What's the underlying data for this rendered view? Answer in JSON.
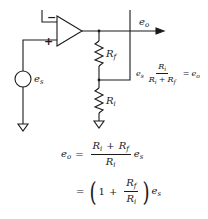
{
  "diagram": {
    "colors": {
      "line": "#1a1a1a",
      "background": "#ffffff"
    },
    "components": {
      "opamp": {
        "minus_label": "−",
        "plus_label": "+"
      },
      "source": {
        "label_base": "e",
        "label_sub": "s"
      },
      "feedback_resistor": {
        "label_base": "R",
        "label_sub": "f"
      },
      "input_resistor": {
        "label_base": "R",
        "label_sub": "i"
      },
      "output": {
        "label_base": "e",
        "label_sub": "o"
      }
    },
    "annotation": {
      "lhs_base": "e",
      "lhs_sub": "s",
      "num_base": "R",
      "num_sub": "i",
      "den_a_base": "R",
      "den_a_sub": "i",
      "den_plus": "+",
      "den_b_base": "R",
      "den_b_sub": "f",
      "equals": "=",
      "rhs_base": "e",
      "rhs_sub": "o"
    },
    "equations": [
      {
        "lhs_base": "e",
        "lhs_sub": "o",
        "equals": "=",
        "num_a_base": "R",
        "num_a_sub": "i",
        "num_plus": "+",
        "num_b_base": "R",
        "num_b_sub": "f",
        "den_base": "R",
        "den_sub": "i",
        "factor_base": "e",
        "factor_sub": "s"
      },
      {
        "equals": "=",
        "open_paren": "(",
        "one": "1",
        "plus": "+",
        "num_base": "R",
        "num_sub": "f",
        "den_base": "R",
        "den_sub": "i",
        "close_paren": ")",
        "factor_base": "e",
        "factor_sub": "s"
      }
    ]
  }
}
